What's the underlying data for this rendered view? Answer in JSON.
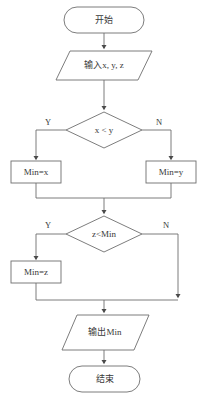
{
  "diagram": {
    "type": "flowchart",
    "language": "zh-CN",
    "canvas": {
      "width": 201,
      "height": 403
    },
    "colors": {
      "background": "#ffffff",
      "stroke": "#6e6e6e",
      "text": "#3a3a3a",
      "arrow": "#4a4a4a"
    },
    "nodes": {
      "start": {
        "label": "开始",
        "shape": "terminator"
      },
      "input": {
        "label": "输入x, y, z",
        "shape": "parallelogram"
      },
      "decision1": {
        "label": "x < y",
        "shape": "diamond"
      },
      "assign_min_x": {
        "label": "Min=x",
        "shape": "rectangle"
      },
      "assign_min_y": {
        "label": "Min=y",
        "shape": "rectangle"
      },
      "decision2": {
        "label": "z<Min",
        "shape": "diamond"
      },
      "assign_min_z": {
        "label": "Min=z",
        "shape": "rectangle"
      },
      "output": {
        "label": "输出Min",
        "shape": "parallelogram"
      },
      "end": {
        "label": "结束",
        "shape": "terminator"
      }
    },
    "branch_labels": {
      "d1_yes": "Y",
      "d1_no": "N",
      "d2_yes": "Y",
      "d2_no": "N"
    }
  }
}
